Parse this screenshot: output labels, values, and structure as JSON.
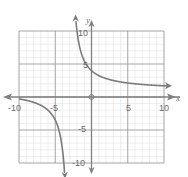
{
  "chart_data": {
    "type": "line",
    "title": "",
    "xlabel": "x",
    "ylabel": "y",
    "xlim": [
      -10,
      10
    ],
    "ylim": [
      -10,
      10
    ],
    "grid": true,
    "minor_grid_step": 1,
    "major_grid_step": 5,
    "x_tick_labels": [
      "-10",
      "-5",
      "5",
      "10"
    ],
    "y_tick_labels": [
      "10",
      "5",
      "-5",
      "-10"
    ],
    "origin_label": "0",
    "function": "rational hyperbola, vertical asymptote near x = -3, horizontal asymptote near y = 1",
    "series": [
      {
        "name": "left-branch",
        "x": [
          -10,
          -8,
          -6,
          -5,
          -4.5,
          -4,
          -3.8
        ],
        "y": [
          -0.3,
          -0.8,
          -2.0,
          -3.5,
          -5.0,
          -8.0,
          -10.0
        ],
        "arrow_end": "down"
      },
      {
        "name": "right-branch",
        "x": [
          -2.1,
          -2,
          -1,
          0,
          2,
          5,
          10
        ],
        "y": [
          10.0,
          8.5,
          5.5,
          4.0,
          2.8,
          2.1,
          1.7
        ],
        "arrow_end": "right",
        "arrow_start": "up"
      }
    ],
    "colors": {
      "curve": "#7a7a7a",
      "axis": "#7f7f7f",
      "major_grid": "#9a9a9a",
      "minor_grid": "#dcdcdc"
    }
  },
  "labels": {
    "x_axis": "x",
    "y_axis": "y",
    "x_ticks": {
      "neg10": "-10",
      "neg5": "-5",
      "pos5": "5",
      "pos10": "10"
    },
    "y_ticks": {
      "pos10": "10",
      "pos5": "5",
      "neg5": "-5",
      "neg10": "-10"
    },
    "origin": "0"
  }
}
